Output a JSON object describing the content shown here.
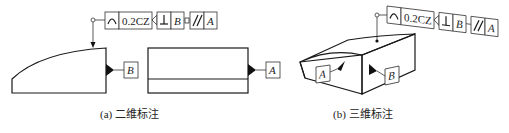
{
  "figure": {
    "panel_a": {
      "caption": "(a) 二维标注",
      "fcf": {
        "profile_symbol": "profile-of-surface-icon",
        "tolerance": "0.2CZ",
        "perpendicular_symbol": "⊥",
        "datum_1": "B",
        "parallel_symbol": "//",
        "datum_2": "A"
      },
      "datum_labels": [
        "B",
        "A"
      ]
    },
    "panel_b": {
      "caption": "(b) 三维标注",
      "fcf": {
        "profile_symbol": "profile-of-surface-icon",
        "tolerance": "0.2CZ",
        "perpendicular_symbol": "⊥",
        "datum_1": "B",
        "parallel_symbol": "//",
        "datum_2": "A"
      },
      "datum_labels": [
        "A",
        "B"
      ]
    }
  }
}
